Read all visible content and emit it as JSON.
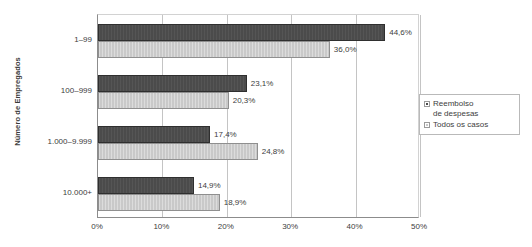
{
  "chart_data": {
    "type": "bar",
    "orientation": "horizontal",
    "title": "",
    "xlabel": "",
    "ylabel": "Número de Empregados",
    "categories": [
      "1–99",
      "100–999",
      "1.000–9.999",
      "10.000+"
    ],
    "series": [
      {
        "name": "Reembolso de despesas",
        "legend_label": "Reembolso\nde despesas",
        "color": "#4b4b4b",
        "values": [
          44.6,
          23.1,
          17.4,
          14.9
        ],
        "value_labels": [
          "44,6%",
          "23,1%",
          "17,4%",
          "14,9%"
        ]
      },
      {
        "name": "Todos os casos",
        "legend_label": "Todos os casos",
        "color": "#c9c9c9",
        "values": [
          36.0,
          20.3,
          24.8,
          18.9
        ],
        "value_labels": [
          "36,0%",
          "20,3%",
          "24,8%",
          "18,9%"
        ]
      }
    ],
    "xlim": [
      0,
      50
    ],
    "x_ticks": [
      0,
      10,
      20,
      30,
      40,
      50
    ],
    "x_tick_labels": [
      "0%",
      "10%",
      "20%",
      "30%",
      "40%",
      "50%"
    ],
    "grid": true,
    "grid_axis": "x",
    "legend_position": "right",
    "colors": {
      "series_dark": "#4b4b4b",
      "series_light": "#c9c9c9",
      "gridline": "#c4c4c4",
      "axis": "#8c8c8c",
      "text": "#3d3d3d",
      "background": "#ffffff"
    }
  }
}
